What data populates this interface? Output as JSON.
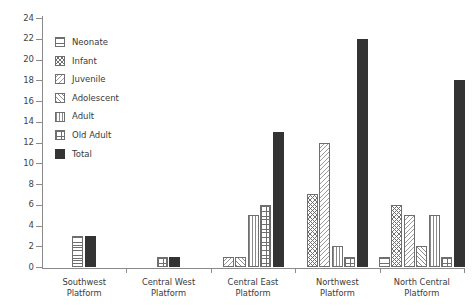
{
  "chart_data": {
    "type": "bar",
    "title": "",
    "subtitle": "",
    "xlabel": "",
    "ylabel": "",
    "ylim": [
      0,
      24
    ],
    "ytick_step": 2,
    "yticks": [
      "0",
      "2",
      "4",
      "6",
      "8",
      "10",
      "12",
      "14",
      "16",
      "18",
      "20",
      "22",
      "24"
    ],
    "grid": false,
    "legend_position": "upper-left-inside",
    "categories": [
      "Southwest Platform",
      "Central West Platform",
      "Central East Platform",
      "Northwest Platform",
      "North Central Platform"
    ],
    "series": [
      {
        "name": "Neonate",
        "pattern": "horizontal-lines",
        "values": [
          3,
          0,
          0,
          0,
          1
        ]
      },
      {
        "name": "Infant",
        "pattern": "dense-crosshatch",
        "values": [
          0,
          0,
          0,
          7,
          6
        ]
      },
      {
        "name": "Juvenile",
        "pattern": "light-diagonal",
        "values": [
          0,
          0,
          1,
          12,
          5
        ]
      },
      {
        "name": "Adolescent",
        "pattern": "diagonal",
        "values": [
          0,
          0,
          1,
          0,
          2
        ]
      },
      {
        "name": "Adult",
        "pattern": "vertical-lines",
        "values": [
          0,
          0,
          5,
          2,
          5
        ]
      },
      {
        "name": "Old Adult",
        "pattern": "grid-crosshatch",
        "values": [
          0,
          1,
          6,
          1,
          1
        ]
      },
      {
        "name": "Total",
        "pattern": "solid",
        "values": [
          3,
          1,
          13,
          22,
          18
        ]
      }
    ]
  },
  "colors": {
    "total_fill": "#333333",
    "outline": "#6f6f6f",
    "axis": "#8a8a8a",
    "text": "#3a3a3a",
    "background": "#ffffff"
  }
}
